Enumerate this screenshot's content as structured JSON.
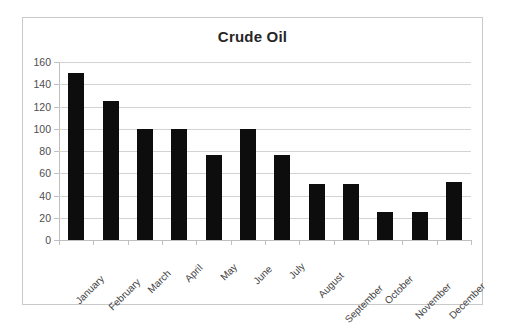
{
  "chart_data": {
    "type": "bar",
    "title": "Crude Oil",
    "xlabel": "",
    "ylabel": "",
    "categories": [
      "January",
      "February",
      "March",
      "April",
      "May",
      "June",
      "July",
      "August",
      "September",
      "October",
      "November",
      "December"
    ],
    "values": [
      150,
      125,
      100,
      100,
      76,
      100,
      76,
      50,
      50,
      25,
      25,
      52
    ],
    "ylim": [
      0,
      160
    ],
    "yticks": [
      0,
      20,
      40,
      60,
      80,
      100,
      120,
      140,
      160
    ],
    "ytick_labels": [
      "0",
      "20",
      "40",
      "60",
      "80",
      "100",
      "120",
      "140",
      "160"
    ],
    "grid": true,
    "legend": false,
    "legend_position": "none",
    "series": [
      {
        "name": "Crude Oil",
        "color": "#0d0d0d",
        "values": [
          150,
          125,
          100,
          100,
          76,
          100,
          76,
          50,
          50,
          25,
          25,
          52
        ]
      }
    ],
    "colors": {
      "bar": "#0d0d0d",
      "gridline": "#d3d3d3",
      "axis": "#bfbfbf",
      "frame_border": "#c9c9c9",
      "background": "#ffffff",
      "title_text": "#262626",
      "tick_text": "#4d4d4d"
    }
  }
}
